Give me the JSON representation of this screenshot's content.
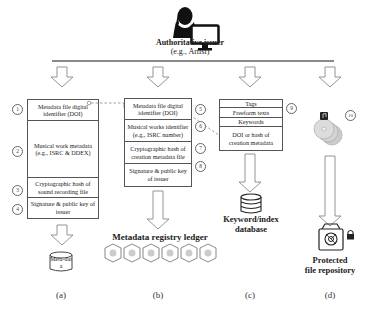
{
  "issuer": {
    "title": "Authoritative issuer",
    "subtitle": "(e.g., Artist)",
    "icons": [
      "person-silhouette-icon",
      "computer-monitor-icon"
    ]
  },
  "columns": {
    "a": {
      "caption": "(a)",
      "rows": [
        {
          "number": "1",
          "text": "Metadata file digital identifier (DOI)"
        },
        {
          "number": "2",
          "text": "Musical work metadata (e.g., ISRC & DDEX)"
        },
        {
          "number": "3",
          "text": "Cryptographic hash of sound recording file"
        },
        {
          "number": "4",
          "text": "Signature & public key of issuer"
        }
      ],
      "output_label": "Meta-data"
    },
    "b": {
      "caption": "(b)",
      "rows": [
        {
          "number": "5",
          "text": "Metadata file digital identifier (DOI)"
        },
        {
          "number": "6",
          "text": "Musical works identifier (e.g., ISRC number)"
        },
        {
          "number": "7",
          "text": "Cryptographic hash of creation metadata file"
        },
        {
          "number": "8",
          "text": "Signature & public key of issuer"
        }
      ],
      "output_label": "Metadata registry ledger",
      "block_count": 6
    },
    "c": {
      "caption": "(c)",
      "number": "9",
      "rows": [
        {
          "text": "Tags"
        },
        {
          "text": "Freeform texts"
        },
        {
          "text": "Keywords"
        },
        {
          "text": "DOI or hash of creation metadata"
        }
      ],
      "output_label_line1": "Keyword/index",
      "output_label_line2": "database"
    },
    "d": {
      "caption": "(d)",
      "number": "10",
      "output_label_line1": "Protected",
      "output_label_line2": "file repository",
      "icons": [
        "music-discs-icon",
        "protected-vault-icon",
        "lock-icon"
      ]
    }
  },
  "colors": {
    "line": "#8a8a8a",
    "box_border": "#555555",
    "arrow_stroke": "#888888",
    "dashed_link": "#777777"
  }
}
